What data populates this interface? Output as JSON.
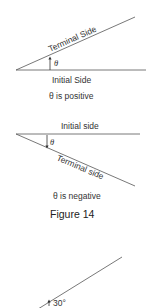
{
  "figure1": {
    "terminal_label": "Terminal Side",
    "initial_label": "Initial Side",
    "angle_label": "θ",
    "caption": "θ is positive"
  },
  "figure2": {
    "initial_label": "Initial side",
    "terminal_label": "Terminal side",
    "angle_label": "θ",
    "caption": "θ is negative"
  },
  "figure_title": "Figure 14",
  "figure3": {
    "angle_label": "30°"
  },
  "colors": {
    "line": "#555555",
    "text": "#333333"
  }
}
